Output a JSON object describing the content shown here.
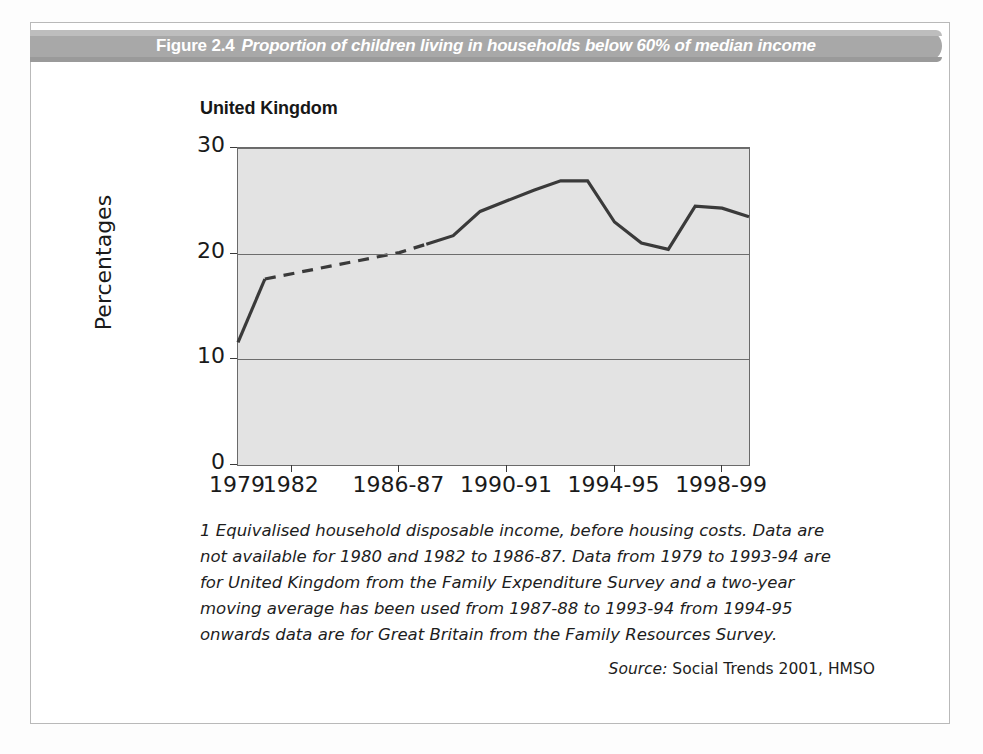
{
  "banner": {
    "figure_number": "Figure 2.4",
    "caption": "Proportion of children living in households below 60% of median income",
    "background_color": "#a8a8a8",
    "text_color": "#ffffff"
  },
  "chart_heading": "United Kingdom",
  "footnote": "1 Equivalised household disposable income, before housing costs. Data are not available for 1980 and 1982 to 1986-87. Data from 1979 to 1993-94 are for United Kingdom from the Family Expenditure Survey and a two-year moving average has been used from 1987-88 to 1993-94 from 1994-95 onwards data are for Great Britain from the Family Resources Survey.",
  "source": {
    "label": "Source:",
    "value": "Social Trends 2001, HMSO"
  },
  "chart_data": {
    "type": "line",
    "title": "Proportion of children living in households below 60% of median income",
    "subtitle": "United Kingdom",
    "xlabel": "",
    "ylabel": "Percentages",
    "ylim": [
      0,
      30
    ],
    "yticks": [
      0,
      10,
      20,
      30
    ],
    "ytick_labels": [
      "0",
      "10",
      "20",
      "30"
    ],
    "xtick_labels": [
      "1979",
      "1982",
      "1986-87",
      "1990-91",
      "1994-95",
      "1998-99"
    ],
    "xtick_positions": [
      0,
      2,
      6,
      10,
      14,
      18
    ],
    "xlim": [
      0,
      19
    ],
    "grid": "horizontal",
    "legend": "none",
    "plot_background_color": "#e3e3e3",
    "line_color": "#3a3a3a",
    "series": [
      {
        "name": "Children in households below 60% of median income",
        "style": "solid",
        "note": "observed data (1979-1981)",
        "points": [
          {
            "x": 0,
            "label": "1979",
            "y": 11.6
          },
          {
            "x": 1,
            "label": "1981",
            "y": 17.6
          }
        ]
      },
      {
        "name": "Interpolated (data not available)",
        "style": "dashed",
        "note": "1982 to 1986-87 data not available",
        "points": [
          {
            "x": 1,
            "label": "1981",
            "y": 17.6
          },
          {
            "x": 6,
            "label": "1986-87",
            "y": 20.1
          },
          {
            "x": 7,
            "label": "1987-88",
            "y": 20.9
          }
        ]
      },
      {
        "name": "Children in households below 60% of median income",
        "style": "solid",
        "note": "observed data (1987-88 to 1998-99)",
        "points": [
          {
            "x": 7,
            "label": "1987-88",
            "y": 20.9
          },
          {
            "x": 8,
            "label": "1988-89",
            "y": 21.7
          },
          {
            "x": 9,
            "label": "1989-90",
            "y": 24.0
          },
          {
            "x": 10,
            "label": "1990-91",
            "y": 25.0
          },
          {
            "x": 11,
            "label": "1991-92",
            "y": 26.0
          },
          {
            "x": 12,
            "label": "1992-93",
            "y": 26.9
          },
          {
            "x": 13,
            "label": "1993-94",
            "y": 26.9
          },
          {
            "x": 14,
            "label": "1994-95",
            "y": 23.0
          },
          {
            "x": 15,
            "label": "1995-96",
            "y": 21.0
          },
          {
            "x": 16,
            "label": "1996-97",
            "y": 20.4
          },
          {
            "x": 17,
            "label": "1997-98",
            "y": 24.5
          },
          {
            "x": 18,
            "label": "1998-99",
            "y": 24.3
          },
          {
            "x": 19,
            "label": "",
            "y": 23.5
          }
        ]
      }
    ]
  }
}
